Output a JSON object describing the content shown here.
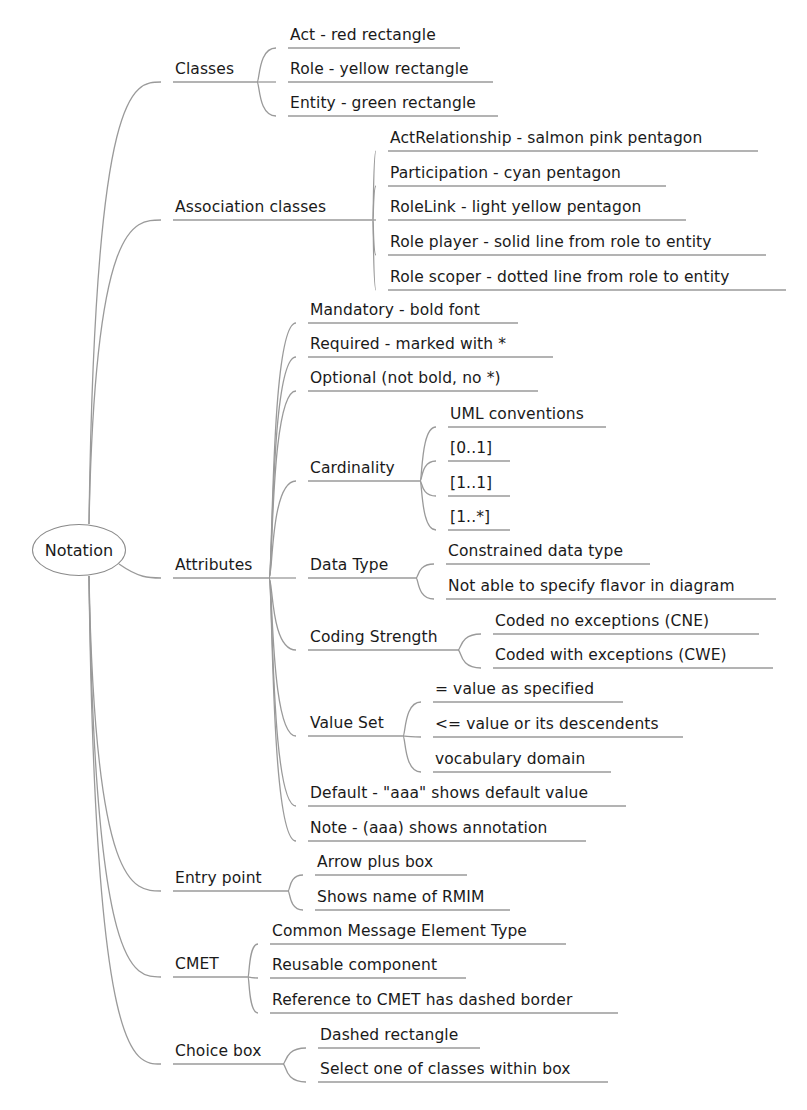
{
  "mindmap": {
    "root": {
      "label": "Notation",
      "cx": 79,
      "cy": 550
    },
    "edge_color": "#9a9a9a",
    "branches": [
      {
        "label": "Classes",
        "x": 173,
        "y": 82,
        "w": 84,
        "children": [
          {
            "label": "Act - red rectangle",
            "x": 288,
            "y": 48,
            "w": 172
          },
          {
            "label": "Role - yellow rectangle",
            "x": 288,
            "y": 82,
            "w": 205
          },
          {
            "label": "Entity - green rectangle",
            "x": 288,
            "y": 116,
            "w": 210
          }
        ]
      },
      {
        "label": "Association classes",
        "x": 173,
        "y": 220,
        "w": 200,
        "children": [
          {
            "label": "ActRelationship - salmon pink pentagon",
            "x": 388,
            "y": 151,
            "w": 370
          },
          {
            "label": "Participation - cyan pentagon",
            "x": 388,
            "y": 186,
            "w": 278
          },
          {
            "label": "RoleLink - light yellow pentagon",
            "x": 388,
            "y": 220,
            "w": 298
          },
          {
            "label": "Role player - solid line from role to entity",
            "x": 388,
            "y": 255,
            "w": 378
          },
          {
            "label": "Role scoper - dotted line from role to entity",
            "x": 388,
            "y": 290,
            "w": 398
          }
        ]
      },
      {
        "label": "Attributes",
        "x": 173,
        "y": 578,
        "w": 96,
        "children": [
          {
            "label": "Mandatory - bold font",
            "x": 308,
            "y": 323,
            "w": 210
          },
          {
            "label": "Required - marked with *",
            "x": 308,
            "y": 357,
            "w": 245
          },
          {
            "label": "Optional (not bold, no *)",
            "x": 308,
            "y": 391,
            "w": 230
          },
          {
            "label": "Cardinality",
            "x": 308,
            "y": 481,
            "w": 112,
            "children": [
              {
                "label": "UML conventions",
                "x": 448,
                "y": 427,
                "w": 158
              },
              {
                "label": "[0..1]",
                "x": 448,
                "y": 461,
                "w": 62
              },
              {
                "label": "[1..1]",
                "x": 448,
                "y": 496,
                "w": 62
              },
              {
                "label": "[1..*]",
                "x": 448,
                "y": 530,
                "w": 62
              }
            ]
          },
          {
            "label": "Data Type",
            "x": 308,
            "y": 578,
            "w": 108,
            "children": [
              {
                "label": "Constrained data type",
                "x": 446,
                "y": 564,
                "w": 204
              },
              {
                "label": "Not able to specify flavor in diagram",
                "x": 446,
                "y": 599,
                "w": 330
              }
            ]
          },
          {
            "label": "Coding Strength",
            "x": 308,
            "y": 650,
            "w": 150,
            "children": [
              {
                "label": "Coded no exceptions (CNE)",
                "x": 493,
                "y": 634,
                "w": 266
              },
              {
                "label": "Coded with exceptions (CWE)",
                "x": 493,
                "y": 668,
                "w": 280
              }
            ]
          },
          {
            "label": "Value Set",
            "x": 308,
            "y": 736,
            "w": 95,
            "children": [
              {
                "label": "= value as specified",
                "x": 433,
                "y": 702,
                "w": 190
              },
              {
                "label": "<= value or its descendents",
                "x": 433,
                "y": 737,
                "w": 250
              },
              {
                "label": "vocabulary domain",
                "x": 433,
                "y": 772,
                "w": 178
              }
            ]
          },
          {
            "label": "Default - \"aaa\" shows default value",
            "x": 308,
            "y": 806,
            "w": 318
          },
          {
            "label": "Note - (aaa) shows annotation",
            "x": 308,
            "y": 841,
            "w": 278
          }
        ]
      },
      {
        "label": "Entry point",
        "x": 173,
        "y": 891,
        "w": 115,
        "children": [
          {
            "label": "Arrow plus box",
            "x": 315,
            "y": 875,
            "w": 152
          },
          {
            "label": "Shows name of RMIM",
            "x": 315,
            "y": 910,
            "w": 195
          }
        ]
      },
      {
        "label": "CMET",
        "x": 173,
        "y": 977,
        "w": 75,
        "children": [
          {
            "label": "Common Message Element Type",
            "x": 270,
            "y": 944,
            "w": 296
          },
          {
            "label": "Reusable component",
            "x": 270,
            "y": 978,
            "w": 196
          },
          {
            "label": "Reference to CMET has dashed border",
            "x": 270,
            "y": 1013,
            "w": 348
          }
        ]
      },
      {
        "label": "Choice box",
        "x": 173,
        "y": 1064,
        "w": 110,
        "children": [
          {
            "label": "Dashed rectangle",
            "x": 318,
            "y": 1048,
            "w": 162
          },
          {
            "label": "Select one of classes within box",
            "x": 318,
            "y": 1082,
            "w": 290
          }
        ]
      }
    ]
  }
}
